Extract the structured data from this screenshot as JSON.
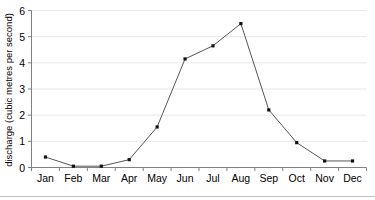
{
  "chart_data": {
    "type": "line",
    "title": "",
    "xlabel": "",
    "ylabel": "discharge (cubic metres per second)",
    "categories": [
      "Jan",
      "Feb",
      "Mar",
      "Apr",
      "May",
      "Jun",
      "Jul",
      "Aug",
      "Sep",
      "Oct",
      "Nov",
      "Dec"
    ],
    "values": [
      0.4,
      0.05,
      0.05,
      0.3,
      1.55,
      4.15,
      4.65,
      5.5,
      2.2,
      0.95,
      0.25,
      0.25
    ],
    "series": [
      {
        "name": "discharge",
        "values": [
          0.4,
          0.05,
          0.05,
          0.3,
          1.55,
          4.15,
          4.65,
          5.5,
          2.2,
          0.95,
          0.25,
          0.25
        ]
      }
    ],
    "ylim": [
      0,
      6
    ],
    "yticks": [
      0,
      1,
      2,
      3,
      4,
      5,
      6
    ],
    "ytick_labels": [
      "0",
      "1",
      "2",
      "3",
      "4",
      "5",
      "6"
    ],
    "grid": true,
    "grid_axis": "y",
    "legend": "none",
    "marker": "square",
    "line_color": "#555555",
    "marker_color": "#111111",
    "grid_color": "#e8e8e8",
    "axis_color": "#808080",
    "background_color": "#ffffff"
  },
  "axes": {
    "y_label_text": "discharge (cubic metres per second)"
  }
}
